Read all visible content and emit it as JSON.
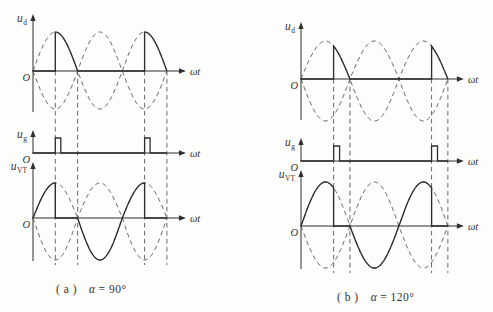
{
  "figure": {
    "background": "#fdfdfc",
    "ink_color": "#2e2e2e",
    "dash_color": "#555555",
    "panels": [
      {
        "id": "a",
        "alpha_deg": 90,
        "caption": {
          "prefix": "( a )",
          "alpha": "α",
          "eq": "= 90°"
        },
        "origin_label": "O",
        "x_axis_label": "ωt",
        "plots": [
          {
            "key": "ud",
            "label_main": "u",
            "label_sub": "d"
          },
          {
            "key": "ug",
            "label_main": "u",
            "label_sub": "g"
          },
          {
            "key": "uvt",
            "label_main": "u",
            "label_sub": "VT"
          }
        ]
      },
      {
        "id": "b",
        "alpha_deg": 120,
        "caption": {
          "prefix": "( b )",
          "alpha": "α",
          "eq": "= 120°"
        },
        "origin_label": "O",
        "x_axis_label": "ωt",
        "plots": [
          {
            "key": "ud",
            "label_main": "u",
            "label_sub": "d"
          },
          {
            "key": "ug",
            "label_main": "u",
            "label_sub": "g"
          },
          {
            "key": "uvt",
            "label_main": "u",
            "label_sub": "VT"
          }
        ]
      }
    ]
  },
  "chart_data": [
    {
      "panel": "a",
      "type": "line",
      "title": "( a ) α = 90°",
      "alpha_deg": 90,
      "x_axis_label": "ωt",
      "x_range_deg": [
        0,
        540
      ],
      "amplitude": 1,
      "dashed_reference": [
        "sin(ωt)",
        "-sin(ωt)"
      ],
      "gridlines_deg": [
        90,
        180,
        450,
        540
      ],
      "series": [
        {
          "name": "u_d",
          "description": "half-wave controlled rectifier output, fires at 90° and 450°",
          "segments": [
            {
              "fn": "zero",
              "range": [
                0,
                90
              ]
            },
            {
              "fn": "sine",
              "range": [
                90,
                180
              ]
            },
            {
              "fn": "zero",
              "range": [
                180,
                450
              ]
            },
            {
              "fn": "sine",
              "range": [
                450,
                540
              ]
            }
          ]
        },
        {
          "name": "u_g",
          "description": "gate trigger pulses",
          "pulses_deg": [
            90,
            450
          ],
          "pulse_width_deg": 22
        },
        {
          "name": "u_VT",
          "description": "thyristor voltage: supply sine while blocking, zero while conducting",
          "segments": [
            {
              "fn": "sine",
              "range": [
                0,
                90
              ]
            },
            {
              "fn": "zero",
              "range": [
                90,
                180
              ]
            },
            {
              "fn": "sine",
              "range": [
                180,
                450
              ]
            },
            {
              "fn": "zero",
              "range": [
                450,
                540
              ]
            }
          ]
        }
      ]
    },
    {
      "panel": "b",
      "type": "line",
      "title": "( b ) α = 120°",
      "alpha_deg": 120,
      "x_axis_label": "ωt",
      "x_range_deg": [
        0,
        540
      ],
      "amplitude": 1,
      "dashed_reference": [
        "sin(ωt)",
        "-sin(ωt)"
      ],
      "gridlines_deg": [
        120,
        180,
        480,
        540
      ],
      "series": [
        {
          "name": "u_d",
          "description": "half-wave controlled rectifier output, fires at 120° and 480°",
          "segments": [
            {
              "fn": "zero",
              "range": [
                0,
                120
              ]
            },
            {
              "fn": "sine",
              "range": [
                120,
                180
              ]
            },
            {
              "fn": "zero",
              "range": [
                180,
                480
              ]
            },
            {
              "fn": "sine",
              "range": [
                480,
                540
              ]
            }
          ]
        },
        {
          "name": "u_g",
          "description": "gate trigger pulses",
          "pulses_deg": [
            120,
            480
          ],
          "pulse_width_deg": 22
        },
        {
          "name": "u_VT",
          "description": "thyristor voltage: supply sine while blocking, zero while conducting",
          "segments": [
            {
              "fn": "sine",
              "range": [
                0,
                120
              ]
            },
            {
              "fn": "zero",
              "range": [
                120,
                180
              ]
            },
            {
              "fn": "sine",
              "range": [
                180,
                480
              ]
            },
            {
              "fn": "zero",
              "range": [
                480,
                540
              ]
            }
          ]
        }
      ]
    }
  ]
}
